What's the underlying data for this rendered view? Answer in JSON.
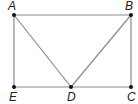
{
  "diagram": {
    "type": "geometry",
    "points": [
      {
        "name": "A",
        "x": 14,
        "y": 15,
        "label_x": 8,
        "label_y": 10
      },
      {
        "name": "B",
        "x": 131,
        "y": 15,
        "label_x": 125,
        "label_y": 10
      },
      {
        "name": "C",
        "x": 131,
        "y": 87,
        "label_x": 127,
        "label_y": 101
      },
      {
        "name": "D",
        "x": 71,
        "y": 87,
        "label_x": 67,
        "label_y": 101
      },
      {
        "name": "E",
        "x": 14,
        "y": 87,
        "label_x": 9,
        "label_y": 101
      }
    ],
    "segments": [
      [
        "A",
        "B"
      ],
      [
        "B",
        "C"
      ],
      [
        "C",
        "D"
      ],
      [
        "D",
        "E"
      ],
      [
        "E",
        "A"
      ],
      [
        "A",
        "D"
      ],
      [
        "B",
        "D"
      ]
    ],
    "line_color": "#8a8a8a",
    "point_color": "#111111"
  }
}
